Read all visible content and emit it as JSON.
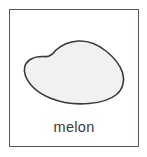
{
  "card": {
    "caption": "melon",
    "illustration": {
      "icon_name": "melon-blob-shape",
      "fill_color": "#f1f1f1",
      "stroke_color": "#3a3a3a"
    },
    "frame": {
      "border_color": "#55585c",
      "background_color": "#ffffff"
    }
  }
}
